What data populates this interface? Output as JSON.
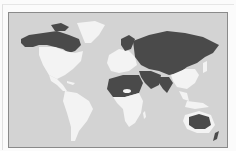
{
  "map": {
    "type": "world-choropleth",
    "colors": {
      "ocean": "#d3d3d3",
      "highlighted": "#4a4a4a",
      "other_land": "#f3f3f3",
      "border": "#8a8a8a"
    },
    "highlighted_regions": [
      "Canada",
      "Russia",
      "Central Asia",
      "Middle East",
      "North Africa",
      "India",
      "Australia",
      "Scandinavia"
    ],
    "other_regions": [
      "Greenland",
      "United States",
      "Mexico",
      "South America",
      "Sub-Saharan Africa",
      "Europe",
      "China",
      "Southeast Asia"
    ]
  }
}
